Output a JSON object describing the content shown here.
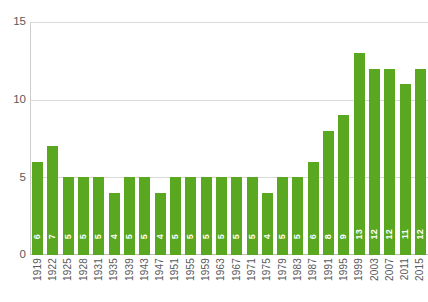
{
  "chart_data": {
    "type": "bar",
    "title": "",
    "subtitle": "",
    "xlabel": "",
    "ylabel": "",
    "ylim": [
      0,
      15
    ],
    "yticks": [
      0,
      5,
      10,
      15
    ],
    "grid": true,
    "legend": false,
    "bar_color": "#5aa81f",
    "value_label_color": "#ffffff",
    "axis_text_color": "#58595b",
    "gridline_color": "#d9d9d9",
    "categories": [
      "1919",
      "1922",
      "1925",
      "1928",
      "1931",
      "1935",
      "1939",
      "1943",
      "1947",
      "1951",
      "1955",
      "1959",
      "1963",
      "1967",
      "1971",
      "1975",
      "1979",
      "1983",
      "1987",
      "1991",
      "1995",
      "1999",
      "2003",
      "2007",
      "2011",
      "2015"
    ],
    "values": [
      6,
      7,
      5,
      5,
      5,
      4,
      5,
      5,
      4,
      5,
      5,
      5,
      5,
      5,
      5,
      4,
      5,
      5,
      6,
      8,
      9,
      13,
      12,
      12,
      11,
      12
    ]
  }
}
